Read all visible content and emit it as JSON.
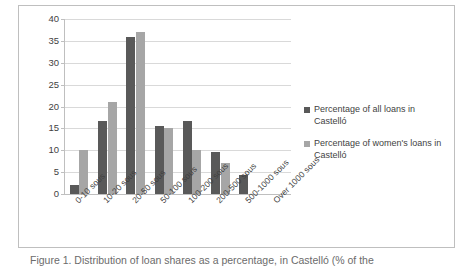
{
  "chart_data": {
    "type": "bar",
    "title": "",
    "xlabel": "",
    "ylabel": "",
    "ylim": [
      0,
      40
    ],
    "ytick_step": 5,
    "yticks": [
      "40",
      "35",
      "30",
      "25",
      "20",
      "15",
      "10",
      "5",
      "0"
    ],
    "grid": true,
    "legend_position": "right",
    "categories": [
      "0-10 sous",
      "10-20 sous",
      "20-50 sous",
      "50-100 sous",
      "100-200 sous",
      "200-500 sous",
      "500-1000 sous",
      "Over 1000 sous"
    ],
    "series": [
      {
        "name": "Percentage of all loans in Castelló",
        "color": "#595959",
        "values": [
          2,
          16.7,
          36,
          15.6,
          16.7,
          9.5,
          4.3,
          0
        ]
      },
      {
        "name": "Percentage of women's loans in Castelló",
        "color": "#a6a6a6",
        "values": [
          10,
          21,
          37,
          15,
          10,
          7,
          0,
          0
        ]
      }
    ]
  },
  "legend": {
    "items": [
      {
        "label": "Percentage of all loans in Castelló",
        "swatch": "series-a"
      },
      {
        "label": "Percentage of women's loans in Castelló",
        "swatch": "series-b"
      }
    ]
  },
  "caption": {
    "text": "Figure 1. Distribution of loan shares as a percentage, in Castelló (% of the"
  },
  "colors": {
    "series_a": "#595959",
    "series_b": "#a6a6a6",
    "gridline": "#d9d9d9",
    "axis": "#bfbfbf",
    "text": "#3f3f3f",
    "frame": "#bfbfbf"
  }
}
